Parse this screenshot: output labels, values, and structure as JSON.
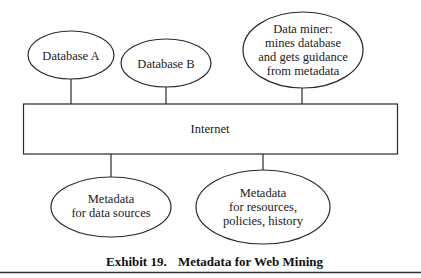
{
  "diagram": {
    "nodes": {
      "database_a": {
        "lines": [
          "Database A"
        ]
      },
      "database_b": {
        "lines": [
          "Database B"
        ]
      },
      "data_miner": {
        "lines": [
          "Data miner:",
          "mines database",
          "and gets guidance",
          "from metadata"
        ]
      },
      "internet": {
        "lines": [
          "Internet"
        ]
      },
      "metadata_sources": {
        "lines": [
          "Metadata",
          "for data sources"
        ]
      },
      "metadata_resources": {
        "lines": [
          "Metadata",
          "for resources,",
          "policies, history"
        ]
      }
    },
    "edges": [
      {
        "from": "database_a",
        "to": "internet"
      },
      {
        "from": "database_b",
        "to": "internet"
      },
      {
        "from": "data_miner",
        "to": "internet"
      },
      {
        "from": "internet",
        "to": "metadata_sources"
      },
      {
        "from": "internet",
        "to": "metadata_resources"
      }
    ]
  },
  "caption": {
    "number": "Exhibit 19.",
    "title": "Metadata for Web Mining"
  }
}
